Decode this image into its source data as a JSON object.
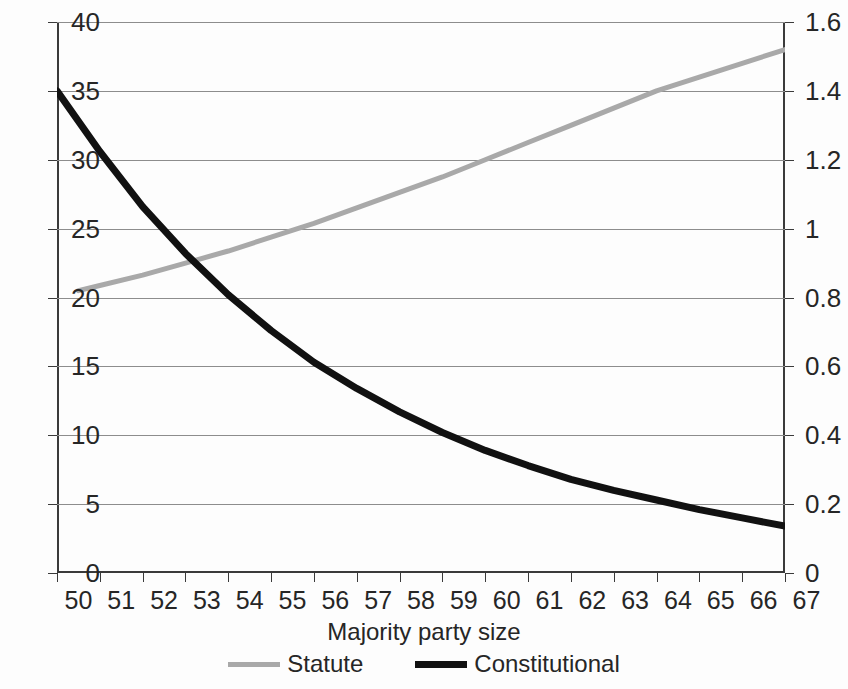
{
  "chart_data": {
    "type": "line",
    "title": "",
    "xlabel": "Majority party size",
    "ylabel": "",
    "ylabel_right": "",
    "xlim": [
      50,
      67
    ],
    "ylim": [
      0,
      40
    ],
    "ylim_right": [
      0,
      1.6
    ],
    "grid": true,
    "legend_position": "bottom",
    "x": [
      50,
      51,
      52,
      53,
      54,
      55,
      56,
      57,
      58,
      59,
      60,
      61,
      62,
      63,
      64,
      65,
      66,
      67
    ],
    "xticklabels": [
      "50",
      "51",
      "52",
      "53",
      "54",
      "55",
      "56",
      "57",
      "58",
      "59",
      "60",
      "61",
      "62",
      "63",
      "64",
      "65",
      "66",
      "67"
    ],
    "yticklabels_left": [
      "0",
      "5",
      "10",
      "15",
      "20",
      "25",
      "30",
      "35",
      "40"
    ],
    "yticks_left": [
      0,
      5,
      10,
      15,
      20,
      25,
      30,
      35,
      40
    ],
    "yticklabels_right": [
      "0",
      "0.2",
      "0.4",
      "0.6",
      "0.8",
      "1",
      "1.2",
      "1.4",
      "1.6"
    ],
    "yticks_right": [
      0,
      0.2,
      0.4,
      0.6,
      0.8,
      1,
      1.2,
      1.4,
      1.6
    ],
    "series": [
      {
        "name": "Statute",
        "axis": "right",
        "color": "#a9a9a9",
        "x": [
          50.5,
          51,
          52,
          53,
          54,
          55,
          56,
          57,
          58,
          59,
          60,
          61,
          62,
          63,
          64,
          65,
          66,
          67
        ],
        "values": [
          0.82,
          0.835,
          0.865,
          0.9,
          0.935,
          0.975,
          1.015,
          1.06,
          1.105,
          1.15,
          1.2,
          1.25,
          1.3,
          1.35,
          1.4,
          1.44,
          1.48,
          1.52
        ]
      },
      {
        "name": "Constitutional",
        "axis": "left",
        "color": "#111111",
        "x": [
          50,
          51,
          52,
          53,
          54,
          55,
          56,
          57,
          58,
          59,
          60,
          61,
          62,
          63,
          64,
          65,
          66,
          67
        ],
        "values": [
          35.0,
          30.6,
          26.6,
          23.2,
          20.2,
          17.6,
          15.3,
          13.4,
          11.7,
          10.2,
          8.9,
          7.8,
          6.8,
          6.0,
          5.3,
          4.6,
          4.0,
          3.4
        ]
      }
    ],
    "annotations": []
  },
  "legend": {
    "items": [
      {
        "label": "Statute",
        "color": "#a9a9a9"
      },
      {
        "label": "Constitutional",
        "color": "#111111"
      }
    ]
  }
}
